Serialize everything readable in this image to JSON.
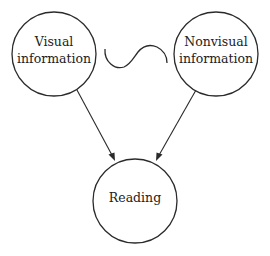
{
  "diagram": {
    "type": "flow",
    "nodes": [
      {
        "id": "visual",
        "lines": [
          "Visual",
          "information"
        ],
        "cx": 54,
        "cy": 54,
        "r": 42
      },
      {
        "id": "nonvisual",
        "lines": [
          "Nonvisual",
          "information"
        ],
        "cx": 216,
        "cy": 54,
        "r": 42
      },
      {
        "id": "reading",
        "lines": [
          "Reading"
        ],
        "cx": 135,
        "cy": 201,
        "r": 42
      }
    ],
    "edges": [
      {
        "from": "visual",
        "to": "reading",
        "style": "arrow"
      },
      {
        "from": "nonvisual",
        "to": "reading",
        "style": "arrow"
      }
    ],
    "connector_between_top_nodes": {
      "symbol": "tilde-wave",
      "meaning": "trade-off"
    },
    "colors": {
      "stroke": "#2a2a2a",
      "text": "#222222",
      "background": "#ffffff"
    }
  },
  "labels": {
    "visual_line1": "Visual",
    "visual_line2": "information",
    "nonvisual_line1": "Nonvisual",
    "nonvisual_line2": "information",
    "reading": "Reading"
  }
}
